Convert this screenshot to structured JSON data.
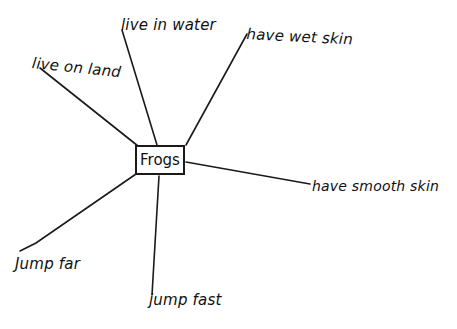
{
  "diagram": {
    "type": "concept-web",
    "center": {
      "label": "Frogs"
    },
    "branches": [
      {
        "id": "live-on-land",
        "label": "live on land"
      },
      {
        "id": "live-in-water",
        "label": "live in water"
      },
      {
        "id": "have-wet-skin",
        "label": "have wet skin"
      },
      {
        "id": "have-smooth-skin",
        "label": "have smooth skin"
      },
      {
        "id": "jump-fast",
        "label": "jump fast"
      },
      {
        "id": "jump-far",
        "label": "Jump far"
      }
    ],
    "colors": {
      "ink": "#1a1a1a",
      "background": "#ffffff"
    }
  }
}
